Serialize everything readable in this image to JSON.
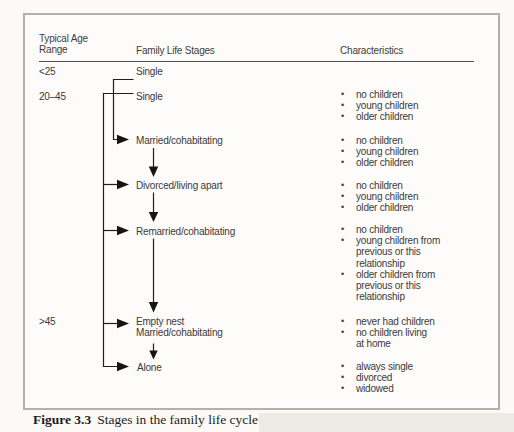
{
  "colors": {
    "page_background": "#fbfaf7",
    "box_border": "#b3b1ac",
    "line_color": "#1f1f1f",
    "text_color": "#3a3a3a",
    "shade_strip": "#edebe6"
  },
  "columns": {
    "age": "Typical Age Range",
    "stages": "Family Life Stages",
    "characteristics": "Characteristics"
  },
  "stages": [
    {
      "age": "<25",
      "label": "Single",
      "characteristics": []
    },
    {
      "age": "20–45",
      "label": "Single",
      "characteristics": [
        [
          "no children"
        ],
        [
          "young children"
        ],
        [
          "older children"
        ]
      ]
    },
    {
      "label": "Married/cohabitating",
      "characteristics": [
        [
          "no children"
        ],
        [
          "young children"
        ],
        [
          "older children"
        ]
      ]
    },
    {
      "label": "Divorced/living apart",
      "characteristics": [
        [
          "no children"
        ],
        [
          "young children"
        ],
        [
          "older children"
        ]
      ]
    },
    {
      "label": "Remarried/cohabitating",
      "characteristics": [
        [
          "no children"
        ],
        [
          "young children from",
          "previous or this",
          "relationship"
        ],
        [
          "older children from",
          "previous or this",
          "relationship"
        ]
      ]
    },
    {
      "age": ">45",
      "label": "Empty nest",
      "label2": "Married/cohabitating",
      "characteristics": [
        [
          "never had children"
        ],
        [
          "no children living",
          "at home"
        ]
      ]
    },
    {
      "label": "Alone",
      "characteristics": [
        [
          "always single"
        ],
        [
          "divorced"
        ],
        [
          "widowed"
        ]
      ]
    }
  ],
  "caption": {
    "label": "Figure 3.3",
    "text": "Stages in the family life cycle"
  }
}
